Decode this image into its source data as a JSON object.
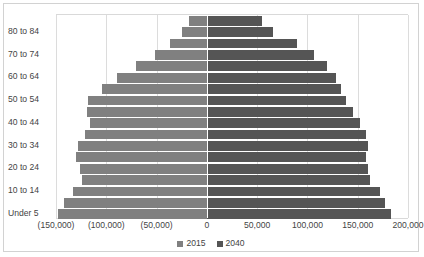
{
  "chart_data": {
    "type": "bar",
    "subtype": "population-pyramid",
    "title": "",
    "xlabel": "",
    "ylabel": "",
    "orientation": "horizontal",
    "grid": true,
    "legend_position": "bottom",
    "xlim": [
      -150000,
      200000
    ],
    "xticks": [
      -150000,
      -100000,
      -50000,
      0,
      50000,
      100000,
      150000,
      200000
    ],
    "xticklabels": [
      "(150,000)",
      "(100,000)",
      "(50,000)",
      "0",
      "50,000",
      "100,000",
      "150,000",
      "200,000"
    ],
    "categories": [
      "Under 5",
      "5 to 9",
      "10 to 14",
      "15 to 19",
      "20 to 24",
      "25 to 29",
      "30 to 34",
      "35 to 39",
      "40 to 44",
      "45 to 49",
      "50 to 54",
      "55 to 59",
      "60 to 64",
      "65 to 69",
      "70 to 74",
      "75 to 79",
      "80 to 84",
      "85 and over"
    ],
    "visible_category_labels": [
      "Under 5",
      "10 to 14",
      "20 to 24",
      "30 to 34",
      "40 to 44",
      "50 to 54",
      "60 to 64",
      "70 to 74",
      "80 to 84"
    ],
    "series": [
      {
        "name": "2015",
        "color": "#808080",
        "side": "left",
        "values": [
          -148000,
          -142000,
          -133000,
          -124000,
          -126000,
          -130000,
          -128000,
          -121000,
          -116000,
          -119000,
          -118000,
          -104000,
          -89000,
          -70000,
          -52000,
          -37000,
          -25000,
          -18000
        ]
      },
      {
        "name": "2040",
        "color": "#555555",
        "side": "right",
        "values": [
          183000,
          177000,
          172000,
          162000,
          160000,
          158000,
          160000,
          158000,
          152000,
          145000,
          138000,
          133000,
          128000,
          119000,
          107000,
          90000,
          66000,
          55000
        ]
      }
    ]
  },
  "legend": {
    "items": [
      {
        "label": "2015",
        "color": "#808080"
      },
      {
        "label": "2040",
        "color": "#555555"
      }
    ]
  }
}
